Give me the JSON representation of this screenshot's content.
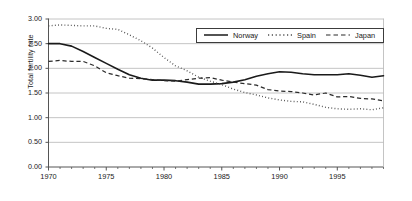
{
  "chart_data": {
    "type": "line",
    "title": "",
    "xlabel": "",
    "ylabel": "Total fertility rate",
    "xlim": [
      1970,
      1999
    ],
    "ylim": [
      0.0,
      3.0
    ],
    "ytick_labels": [
      "3.00",
      "2.50",
      "2.00",
      "1.50",
      "1.00",
      "0.50",
      "0.00"
    ],
    "ytick_values": [
      3.0,
      2.5,
      2.0,
      1.5,
      1.0,
      0.5,
      0.0
    ],
    "xtick_labels": [
      "1970",
      "1975",
      "1980",
      "1985",
      "1990",
      "1995"
    ],
    "xtick_values": [
      1970,
      1975,
      1980,
      1985,
      1990,
      1995
    ],
    "grid": "horizontal",
    "legend_position": "top-right",
    "x": [
      1970,
      1971,
      1972,
      1973,
      1974,
      1975,
      1976,
      1977,
      1978,
      1979,
      1980,
      1981,
      1982,
      1983,
      1984,
      1985,
      1986,
      1987,
      1988,
      1989,
      1990,
      1991,
      1992,
      1993,
      1994,
      1995,
      1996,
      1997,
      1998,
      1999
    ],
    "series": [
      {
        "name": "Norway",
        "style": "solid",
        "color": "#1a1a1a",
        "values": [
          2.5,
          2.5,
          2.45,
          2.34,
          2.22,
          2.1,
          1.98,
          1.87,
          1.8,
          1.76,
          1.76,
          1.75,
          1.72,
          1.68,
          1.68,
          1.69,
          1.72,
          1.77,
          1.84,
          1.89,
          1.93,
          1.92,
          1.89,
          1.87,
          1.87,
          1.87,
          1.89,
          1.86,
          1.82,
          1.85
        ]
      },
      {
        "name": "Spain",
        "style": "dotted",
        "color": "#4d4d4d",
        "values": [
          2.86,
          2.88,
          2.87,
          2.86,
          2.86,
          2.81,
          2.79,
          2.68,
          2.56,
          2.41,
          2.22,
          2.05,
          1.95,
          1.82,
          1.74,
          1.67,
          1.58,
          1.51,
          1.46,
          1.4,
          1.36,
          1.33,
          1.32,
          1.27,
          1.21,
          1.18,
          1.17,
          1.18,
          1.16,
          1.2
        ]
      },
      {
        "name": "Japan",
        "style": "dashed",
        "color": "#2b2b2b",
        "values": [
          2.14,
          2.16,
          2.14,
          2.14,
          2.05,
          1.91,
          1.85,
          1.8,
          1.79,
          1.77,
          1.75,
          1.74,
          1.77,
          1.8,
          1.81,
          1.76,
          1.72,
          1.69,
          1.66,
          1.57,
          1.54,
          1.53,
          1.5,
          1.46,
          1.5,
          1.42,
          1.43,
          1.39,
          1.38,
          1.34
        ]
      }
    ]
  },
  "legend": {
    "items": [
      {
        "label": "Norway",
        "style": "solid"
      },
      {
        "label": "Spain",
        "style": "dotted"
      },
      {
        "label": "Japan",
        "style": "dashed"
      }
    ]
  }
}
